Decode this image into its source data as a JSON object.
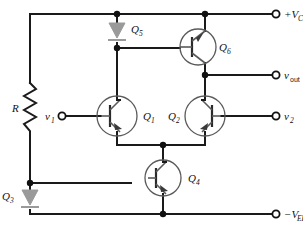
{
  "diagram": {
    "type": "circuit-schematic",
    "width": 303,
    "height": 233,
    "colors": {
      "wire": "#1a1a1a",
      "device_outline": "#5a5a5a",
      "current_source": "#9a9a9a",
      "background": "#ffffff",
      "label": "#111111"
    }
  },
  "rails": {
    "positive": {
      "label": "+V",
      "subscript": "CC",
      "terminal": "open-circle"
    },
    "negative": {
      "label": "−V",
      "subscript": "EE",
      "terminal": "open-circle"
    }
  },
  "terminals": [
    {
      "id": "vcc",
      "label": "+V",
      "sub": "CC",
      "x": 285,
      "y": 14
    },
    {
      "id": "vout",
      "label": "v",
      "sub": "out",
      "x": 285,
      "y": 75
    },
    {
      "id": "v2",
      "label": "v",
      "sub": "2",
      "x": 285,
      "y": 116
    },
    {
      "id": "v1",
      "label": "v",
      "sub": "1",
      "x": 58,
      "y": 116
    },
    {
      "id": "vee",
      "label": "−V",
      "sub": "EE",
      "x": 285,
      "y": 214
    }
  ],
  "components": [
    {
      "id": "R",
      "label": "R",
      "sub": "",
      "type": "resistor",
      "note": "bias resistor from +Vcc rail to Q4 base node"
    },
    {
      "id": "Q1",
      "label": "Q",
      "sub": "1",
      "type": "npn-transistor",
      "note": "left differential pair input, base driven by v1"
    },
    {
      "id": "Q2",
      "label": "Q",
      "sub": "2",
      "type": "npn-transistor",
      "note": "right differential pair input, base driven by v2, mirrored"
    },
    {
      "id": "Q3",
      "label": "Q",
      "sub": "3",
      "type": "current-source",
      "note": "current source from bias node to -Vee"
    },
    {
      "id": "Q4",
      "label": "Q",
      "sub": "4",
      "type": "npn-transistor",
      "note": "tail current source transistor, emitter to -Vee"
    },
    {
      "id": "Q5",
      "label": "Q",
      "sub": "5",
      "type": "current-source",
      "note": "current source from +Vcc to Q1 collector"
    },
    {
      "id": "Q6",
      "label": "Q",
      "sub": "6",
      "type": "npn-transistor",
      "note": "output emitter follower, collector to +Vcc"
    }
  ],
  "labels": {
    "R": "R",
    "Q1": "Q",
    "Q1_sub": "1",
    "Q2": "Q",
    "Q2_sub": "2",
    "Q3": "Q",
    "Q3_sub": "3",
    "Q4": "Q",
    "Q4_sub": "4",
    "Q5": "Q",
    "Q5_sub": "5",
    "Q6": "Q",
    "Q6_sub": "6",
    "vcc": "+V",
    "vcc_sub": "CC",
    "vee": "−V",
    "vee_sub": "EE",
    "vout": "v",
    "vout_sub": "out",
    "v1": "v",
    "v1_sub": "1",
    "v2": "v",
    "v2_sub": "2"
  }
}
